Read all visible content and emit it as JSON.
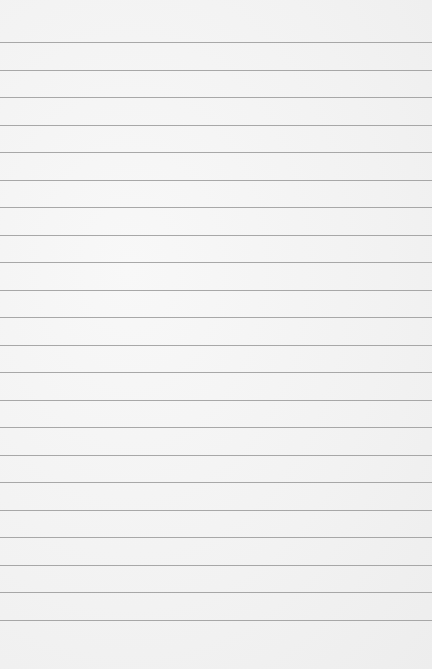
{
  "paper": {
    "type": "lined-paper",
    "background_color": "#f3f3f3",
    "line_color": "#9a9a9a",
    "first_line_y": 42,
    "line_spacing": 27.5,
    "line_count": 22
  }
}
